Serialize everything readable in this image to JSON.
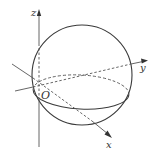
{
  "figure": {
    "type": "3d-coordinate-sphere",
    "colors": {
      "stroke": "#3a3a3a",
      "axis": "#555555",
      "background": "#ffffff"
    },
    "axes": {
      "z": {
        "label": "z"
      },
      "y": {
        "label": "y"
      },
      "x": {
        "label": "x"
      }
    },
    "origin": {
      "label": "O"
    },
    "sphere": {
      "outline": "solid",
      "equator_front": "solid",
      "equator_back": "dashed"
    }
  }
}
